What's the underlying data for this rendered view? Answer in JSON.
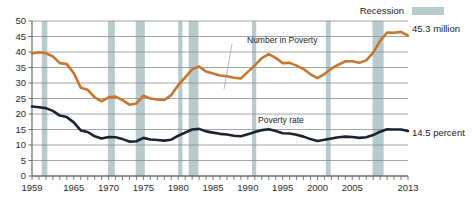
{
  "legend": {
    "recession_label": "Recession",
    "recession_color": "#b7cacd"
  },
  "annotations": {
    "number_label": "Number in Poverty",
    "rate_label": "Poverty rate",
    "right_top": "45.3 million",
    "right_bottom": "14.5 percent"
  },
  "chart_data": {
    "type": "line",
    "title": "",
    "subtitle": "",
    "xlabel": "",
    "ylabel": "",
    "xlim": [
      1959,
      2013
    ],
    "ylim": [
      0,
      50
    ],
    "yticks": [
      0,
      5,
      10,
      15,
      20,
      25,
      30,
      35,
      40,
      45,
      50
    ],
    "xticks_labeled": [
      1959,
      1965,
      1970,
      1975,
      1980,
      1985,
      1990,
      1995,
      2000,
      2005,
      2013
    ],
    "xtick_step": 1,
    "grid": "horizontal",
    "legend_position": "top-right",
    "x": [
      1959,
      1960,
      1961,
      1962,
      1963,
      1964,
      1965,
      1966,
      1967,
      1968,
      1969,
      1970,
      1971,
      1972,
      1973,
      1974,
      1975,
      1976,
      1977,
      1978,
      1979,
      1980,
      1981,
      1982,
      1983,
      1984,
      1985,
      1986,
      1987,
      1988,
      1989,
      1990,
      1991,
      1992,
      1993,
      1994,
      1995,
      1996,
      1997,
      1998,
      1999,
      2000,
      2001,
      2002,
      2003,
      2004,
      2005,
      2006,
      2007,
      2008,
      2009,
      2010,
      2011,
      2012,
      2013
    ],
    "series": [
      {
        "name": "Number in Poverty",
        "units": "millions",
        "color": "#c8762d",
        "values": [
          39.5,
          39.9,
          39.6,
          38.6,
          36.4,
          36.1,
          33.2,
          28.5,
          27.8,
          25.4,
          24.1,
          25.4,
          25.6,
          24.5,
          23.0,
          23.4,
          25.9,
          25.0,
          24.7,
          24.5,
          26.1,
          29.3,
          31.8,
          34.4,
          35.3,
          33.7,
          33.1,
          32.4,
          32.2,
          31.7,
          31.5,
          33.6,
          35.7,
          38.0,
          39.3,
          38.1,
          36.4,
          36.5,
          35.6,
          34.5,
          32.8,
          31.6,
          32.9,
          34.6,
          35.9,
          37.0,
          37.0,
          36.5,
          37.3,
          39.8,
          43.6,
          46.3,
          46.2,
          46.5,
          45.3
        ]
      },
      {
        "name": "Poverty rate",
        "units": "percent",
        "color": "#1a2433",
        "values": [
          22.4,
          22.2,
          21.9,
          21.0,
          19.5,
          19.0,
          17.3,
          14.7,
          14.2,
          12.8,
          12.1,
          12.6,
          12.5,
          11.9,
          11.1,
          11.2,
          12.3,
          11.8,
          11.6,
          11.4,
          11.7,
          13.0,
          14.0,
          15.0,
          15.2,
          14.4,
          14.0,
          13.6,
          13.4,
          13.0,
          12.8,
          13.5,
          14.2,
          14.8,
          15.1,
          14.5,
          13.8,
          13.7,
          13.3,
          12.7,
          11.9,
          11.3,
          11.7,
          12.1,
          12.5,
          12.7,
          12.6,
          12.3,
          12.5,
          13.2,
          14.3,
          15.1,
          15.0,
          15.0,
          14.5
        ]
      }
    ],
    "recession_bands": [
      {
        "start": 1960.4,
        "end": 1961.2
      },
      {
        "start": 1969.9,
        "end": 1970.9
      },
      {
        "start": 1973.9,
        "end": 1975.2
      },
      {
        "start": 1980.0,
        "end": 1980.6
      },
      {
        "start": 1981.5,
        "end": 1982.9
      },
      {
        "start": 1990.6,
        "end": 1991.2
      },
      {
        "start": 2001.2,
        "end": 2001.9
      },
      {
        "start": 2007.9,
        "end": 2009.5
      }
    ]
  }
}
